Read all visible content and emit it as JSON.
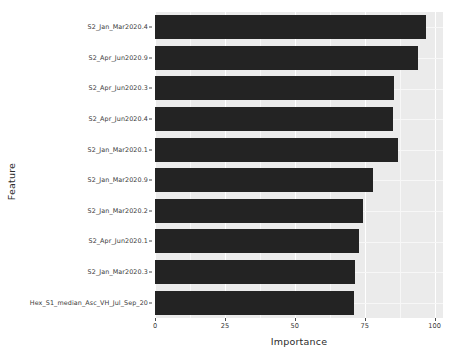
{
  "chart_data": {
    "type": "bar",
    "orientation": "horizontal",
    "title": "",
    "xlabel": "Importance",
    "ylabel": "Feature",
    "xlim": [
      0,
      103
    ],
    "xticks": [
      0,
      25,
      50,
      75,
      100
    ],
    "xtick_labels": [
      "0",
      "25",
      "50",
      "75",
      "100"
    ],
    "grid": true,
    "legend": null,
    "bar_color": "#232323",
    "panel_color": "#ebebeb",
    "gridline_color": "#ffffff",
    "categories": [
      "S2_Jan_Mar2020.4",
      "S2_Apr_Jun2020.9",
      "S2_Apr_Jun2020.3",
      "S2_Apr_Jun2020.4",
      "S2_Jan_Mar2020.1",
      "S2_Jan_Mar2020.9",
      "S2_Jan_Mar2020.2",
      "S2_Apr_Jun2020.1",
      "S2_Jan_Mar2020.3",
      "Hex_S1_median_Asc_VH_Jul_Sep_20"
    ],
    "values": [
      97,
      94,
      85.5,
      85,
      87,
      78,
      74.5,
      73,
      71.5,
      71
    ]
  }
}
